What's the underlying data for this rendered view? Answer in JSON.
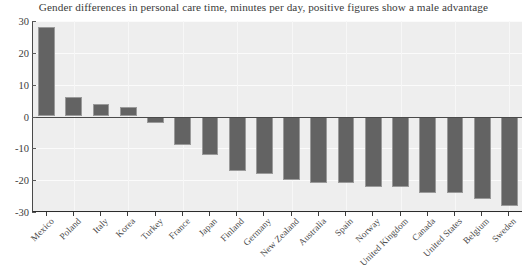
{
  "chart_data": {
    "type": "bar",
    "title": "Gender differences in personal care time, minutes per day, positive figures show a male advantage",
    "xlabel": "",
    "ylabel": "",
    "ylim": [
      -30,
      30
    ],
    "yticks": [
      30,
      20,
      10,
      0,
      -10,
      -20,
      -30
    ],
    "ytick_labels": [
      "30",
      "20",
      "10",
      "0",
      "-10",
      "-20",
      "-30"
    ],
    "grid": true,
    "legend": null,
    "categories": [
      "Mexico",
      "Poland",
      "Italy",
      "Korea",
      "Turkey",
      "France",
      "Japan",
      "Finland",
      "Germany",
      "New Zealand",
      "Australia",
      "Spain",
      "Norway",
      "United Kingdom",
      "Canada",
      "United States",
      "Belgium",
      "Sweden"
    ],
    "values": [
      28,
      6,
      4,
      3,
      -2,
      -9,
      -12,
      -17,
      -18,
      -20,
      -21,
      -21,
      -22,
      -22,
      -24,
      -24,
      -26,
      -28
    ],
    "bar_color": "#636363",
    "bar_edge_color": "#9a9a9a",
    "plot_background": "#eeeeee",
    "axis_color": "#3c3c3c",
    "zero_line_color": "#4a4a4a"
  }
}
